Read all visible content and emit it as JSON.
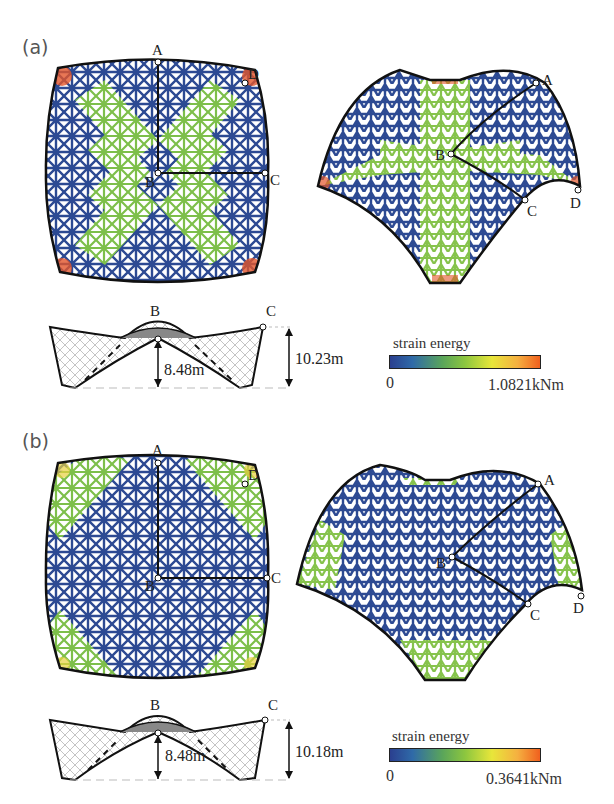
{
  "figure": {
    "panels": [
      {
        "id": "a",
        "label": "(a)",
        "plan_view": {
          "points": [
            "A",
            "B",
            "C",
            "D"
          ]
        },
        "perspective_view": {
          "points": [
            "A",
            "B",
            "C",
            "D"
          ]
        },
        "section": {
          "points": [
            "B",
            "C"
          ],
          "height_B": "8.48m",
          "height_C": "10.23m"
        },
        "legend": {
          "title": "strain energy",
          "min": "0",
          "max": "1.0821kNm"
        }
      },
      {
        "id": "b",
        "label": "(b)",
        "plan_view": {
          "points": [
            "A",
            "B",
            "C",
            "D"
          ]
        },
        "perspective_view": {
          "points": [
            "A",
            "B",
            "C",
            "D"
          ]
        },
        "section": {
          "points": [
            "B",
            "C"
          ],
          "height_B": "8.48m",
          "height_C": "10.18m"
        },
        "legend": {
          "title": "strain energy",
          "min": "0",
          "max": "0.3641kNm"
        }
      }
    ],
    "colormap": [
      "#2a3f8f",
      "#2f6aa8",
      "#5aa55a",
      "#8cc63f",
      "#e8e63a",
      "#f5b040",
      "#f0601e"
    ]
  }
}
